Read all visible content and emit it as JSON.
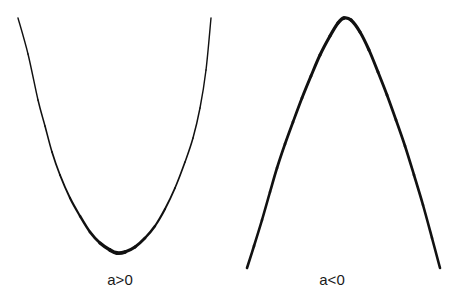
{
  "figure": {
    "title": "",
    "background_color": "#ffffff",
    "stroke_color": "#111111",
    "width": 462,
    "height": 301
  },
  "panels": [
    {
      "id": "upward-parabola",
      "label": "a>0",
      "label_x": 120,
      "label_y": 272,
      "direction": "opens-upward",
      "stroke_color": "#111111"
    },
    {
      "id": "downward-parabola",
      "label": "a<0",
      "label_x": 332,
      "label_y": 272,
      "direction": "opens-downward",
      "stroke_color": "#111111"
    }
  ],
  "chart_data": {
    "type": "line",
    "title": "",
    "xlabel": "",
    "ylabel": "",
    "grid": false,
    "legend": "none",
    "axes_visible": false,
    "tick_labels": [],
    "annotations": [
      {
        "text": "a>0",
        "x": 120,
        "y": 280
      },
      {
        "text": "a<0",
        "x": 332,
        "y": 280
      }
    ],
    "series": [
      {
        "name": "a>0",
        "equation": "y = a*x^2 + c, a > 0",
        "orientation": "upward",
        "vertex": [
          117,
          253
        ],
        "x_start": 18,
        "x_end": 211,
        "y_at_ends": 18,
        "stroke_width_min": 1.4,
        "stroke_width_max": 4.0,
        "points": [
          [
            18,
            18
          ],
          [
            28,
            54
          ],
          [
            38,
            100
          ],
          [
            45,
            126
          ],
          [
            52,
            152
          ],
          [
            60,
            175
          ],
          [
            70,
            198
          ],
          [
            80,
            216
          ],
          [
            90,
            232
          ],
          [
            100,
            243
          ],
          [
            110,
            250
          ],
          [
            117,
            253
          ],
          [
            125,
            252
          ],
          [
            135,
            247
          ],
          [
            145,
            238
          ],
          [
            155,
            226
          ],
          [
            165,
            209
          ],
          [
            175,
            188
          ],
          [
            185,
            162
          ],
          [
            193,
            138
          ],
          [
            200,
            108
          ],
          [
            206,
            70
          ],
          [
            211,
            18
          ]
        ]
      },
      {
        "name": "a<0",
        "equation": "y = a*x^2 + c, a < 0",
        "orientation": "downward",
        "vertex": [
          344,
          18
        ],
        "x_start": 247,
        "x_end": 440,
        "y_at_ends": 268,
        "stroke_width_min": 2.6,
        "stroke_width_max": 3.4,
        "points": [
          [
            247,
            268
          ],
          [
            254,
            246
          ],
          [
            262,
            220
          ],
          [
            270,
            192
          ],
          [
            277,
            168
          ],
          [
            285,
            144
          ],
          [
            293,
            122
          ],
          [
            302,
            98
          ],
          [
            311,
            76
          ],
          [
            320,
            55
          ],
          [
            330,
            36
          ],
          [
            338,
            23
          ],
          [
            344,
            18
          ],
          [
            351,
            20
          ],
          [
            360,
            32
          ],
          [
            369,
            50
          ],
          [
            378,
            72
          ],
          [
            387,
            95
          ],
          [
            396,
            120
          ],
          [
            405,
            146
          ],
          [
            414,
            175
          ],
          [
            423,
            205
          ],
          [
            432,
            238
          ],
          [
            440,
            268
          ]
        ]
      }
    ]
  }
}
